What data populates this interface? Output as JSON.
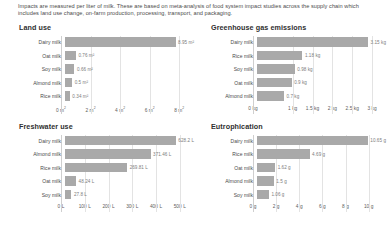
{
  "intro": {
    "text": "Impacts are measured per liter of milk. These are based on meta-analysis of food system impact studies across the supply chain which includes land use change, on-farm production, processing, transport, and packaging."
  },
  "colors": {
    "bar": "#a9a9a9",
    "gridline": "#e3e3e3",
    "text": "#4a4a4a",
    "value_text": "#7d7d7d"
  },
  "chart_data": [
    {
      "type": "bar",
      "title": "Land use",
      "orientation": "horizontal",
      "xlabel": "",
      "ylabel": "",
      "unit": "m²",
      "xlim": [
        0,
        9
      ],
      "grid": true,
      "legend": "none",
      "categories": [
        "Dairy milk",
        "Oat milk",
        "Soy milk",
        "Almond milk",
        "Rice milk"
      ],
      "values": [
        8.95,
        0.76,
        0.66,
        0.5,
        0.34
      ],
      "value_labels": [
        "8.95 m²",
        "0.76 m²",
        "0.66 m²",
        "0.5 m²",
        "0.34 m²"
      ],
      "ticks": [
        0,
        2,
        4,
        6,
        8
      ],
      "tick_labels": [
        "0 m²",
        "2 m²",
        "4 m²",
        "6 m²",
        "8 m²"
      ]
    },
    {
      "type": "bar",
      "title": "Greenhouse gas emissions",
      "orientation": "horizontal",
      "xlabel": "",
      "ylabel": "",
      "unit": "kg",
      "xlim": [
        0,
        3.35
      ],
      "grid": true,
      "legend": "none",
      "categories": [
        "Dairy milk",
        "Rice milk",
        "Soy milk",
        "Oat milk",
        "Almond milk"
      ],
      "values": [
        3.15,
        1.18,
        0.98,
        0.9,
        0.7
      ],
      "value_labels": [
        "3.15 kg",
        "1.18 kg",
        "0.98 kg",
        "0.9 kg",
        "0.7 kg"
      ],
      "ticks": [
        0,
        1,
        1.5,
        2,
        2.5,
        3
      ],
      "tick_labels": [
        "0 kg",
        "1 kg",
        "1.5 kg",
        "2 kg",
        "2.5 kg",
        "3 kg"
      ]
    },
    {
      "type": "bar",
      "title": "Freshwater use",
      "orientation": "horizontal",
      "xlabel": "",
      "ylabel": "",
      "unit": "L",
      "xlim": [
        0,
        560
      ],
      "grid": true,
      "legend": "none",
      "categories": [
        "Dairy milk",
        "Almond milk",
        "Rice milk",
        "Oat milk",
        "Soy milk"
      ],
      "values": [
        628.2,
        371.46,
        269.81,
        48.24,
        27.8
      ],
      "value_labels": [
        "628.2 L",
        "371.46 L",
        "269.81 L",
        "48.24 L",
        "27.8 L"
      ],
      "ticks": [
        0,
        100,
        200,
        300,
        400,
        500
      ],
      "tick_labels": [
        "0 L",
        "100 L",
        "200 L",
        "300 L",
        "400 L",
        "500 L"
      ]
    },
    {
      "type": "bar",
      "title": "Eutrophication",
      "orientation": "horizontal",
      "xlabel": "",
      "ylabel": "",
      "unit": "g",
      "xlim": [
        0,
        11.5
      ],
      "grid": true,
      "legend": "none",
      "categories": [
        "Dairy milk",
        "Rice milk",
        "Oat milk",
        "Almond milk",
        "Soy milk"
      ],
      "values": [
        10.65,
        4.69,
        1.62,
        1.5,
        1.06
      ],
      "value_labels": [
        "10.65 g",
        "4.69 g",
        "1.62 g",
        "1.5 g",
        "1.06 g"
      ],
      "ticks": [
        0,
        2,
        4,
        6,
        8,
        10
      ],
      "tick_labels": [
        "0 g",
        "2 g",
        "4 g",
        "6 g",
        "8 g",
        "10 g"
      ]
    }
  ]
}
